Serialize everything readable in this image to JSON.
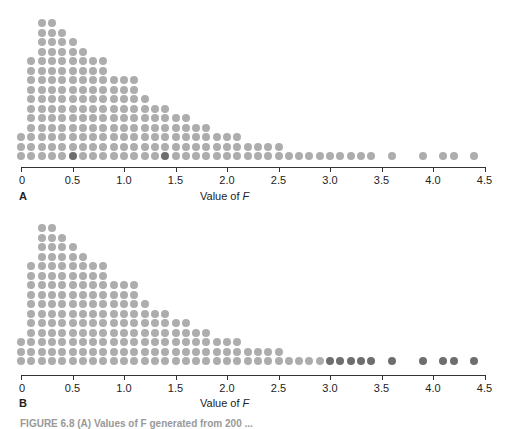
{
  "chart_data": [
    {
      "type": "scatter",
      "subtype": "dot-plot",
      "panel": "A",
      "xlabel": "Value of F",
      "xlim": [
        0,
        4.5
      ],
      "x_ticks": [
        "0",
        "0.5",
        "1.0",
        "1.5",
        "2.0",
        "2.5",
        "3.0",
        "3.5",
        "4.0",
        "4.5"
      ],
      "columns": [
        {
          "x": 0.0,
          "count": 3
        },
        {
          "x": 0.1,
          "count": 11
        },
        {
          "x": 0.2,
          "count": 15
        },
        {
          "x": 0.3,
          "count": 15
        },
        {
          "x": 0.4,
          "count": 14
        },
        {
          "x": 0.5,
          "count": 13
        },
        {
          "x": 0.6,
          "count": 12
        },
        {
          "x": 0.7,
          "count": 11
        },
        {
          "x": 0.8,
          "count": 11
        },
        {
          "x": 0.9,
          "count": 9
        },
        {
          "x": 1.0,
          "count": 9
        },
        {
          "x": 1.1,
          "count": 9
        },
        {
          "x": 1.2,
          "count": 7
        },
        {
          "x": 1.3,
          "count": 6
        },
        {
          "x": 1.4,
          "count": 6
        },
        {
          "x": 1.5,
          "count": 5
        },
        {
          "x": 1.6,
          "count": 5
        },
        {
          "x": 1.7,
          "count": 4
        },
        {
          "x": 1.8,
          "count": 4
        },
        {
          "x": 1.9,
          "count": 3
        },
        {
          "x": 2.0,
          "count": 3
        },
        {
          "x": 2.1,
          "count": 3
        },
        {
          "x": 2.2,
          "count": 2
        },
        {
          "x": 2.3,
          "count": 2
        },
        {
          "x": 2.4,
          "count": 2
        },
        {
          "x": 2.5,
          "count": 2
        },
        {
          "x": 2.6,
          "count": 1
        },
        {
          "x": 2.7,
          "count": 1
        },
        {
          "x": 2.8,
          "count": 1
        },
        {
          "x": 2.9,
          "count": 1
        },
        {
          "x": 3.0,
          "count": 1
        },
        {
          "x": 3.1,
          "count": 1
        },
        {
          "x": 3.2,
          "count": 1
        },
        {
          "x": 3.3,
          "count": 1
        },
        {
          "x": 3.4,
          "count": 1
        },
        {
          "x": 3.6,
          "count": 1
        },
        {
          "x": 3.9,
          "count": 1
        },
        {
          "x": 4.1,
          "count": 1
        },
        {
          "x": 4.2,
          "count": 1
        },
        {
          "x": 4.4,
          "count": 1
        }
      ],
      "highlighted": [
        0.5,
        1.4
      ]
    },
    {
      "type": "scatter",
      "subtype": "dot-plot",
      "panel": "B",
      "xlabel": "Value of F",
      "xlim": [
        0,
        4.5
      ],
      "x_ticks": [
        "0",
        "0.5",
        "1.0",
        "1.5",
        "2.0",
        "2.5",
        "3.0",
        "3.5",
        "4.0",
        "4.5"
      ],
      "columns": "same as panel A",
      "highlighted": [
        3.0,
        3.1,
        3.2,
        3.3,
        3.4,
        3.6,
        3.9,
        4.1,
        4.2,
        4.4
      ]
    }
  ],
  "panels": {
    "a": {
      "letter": "A",
      "xlabel": "Value of ",
      "xlabel_var": "F"
    },
    "b": {
      "letter": "B",
      "xlabel": "Value of ",
      "xlabel_var": "F"
    }
  },
  "ticks": [
    "0",
    "0.5",
    "1.0",
    "1.5",
    "2.0",
    "2.5",
    "3.0",
    "3.5",
    "4.0",
    "4.5"
  ],
  "columns": [
    [
      0.0,
      3
    ],
    [
      0.1,
      11
    ],
    [
      0.2,
      15
    ],
    [
      0.3,
      15
    ],
    [
      0.4,
      14
    ],
    [
      0.5,
      13
    ],
    [
      0.6,
      12
    ],
    [
      0.7,
      11
    ],
    [
      0.8,
      11
    ],
    [
      0.9,
      9
    ],
    [
      1.0,
      9
    ],
    [
      1.1,
      9
    ],
    [
      1.2,
      7
    ],
    [
      1.3,
      6
    ],
    [
      1.4,
      6
    ],
    [
      1.5,
      5
    ],
    [
      1.6,
      5
    ],
    [
      1.7,
      4
    ],
    [
      1.8,
      4
    ],
    [
      1.9,
      3
    ],
    [
      2.0,
      3
    ],
    [
      2.1,
      3
    ],
    [
      2.2,
      2
    ],
    [
      2.3,
      2
    ],
    [
      2.4,
      2
    ],
    [
      2.5,
      2
    ],
    [
      2.6,
      1
    ],
    [
      2.7,
      1
    ],
    [
      2.8,
      1
    ],
    [
      2.9,
      1
    ],
    [
      3.0,
      1
    ],
    [
      3.1,
      1
    ],
    [
      3.2,
      1
    ],
    [
      3.3,
      1
    ],
    [
      3.4,
      1
    ],
    [
      3.6,
      1
    ],
    [
      3.9,
      1
    ],
    [
      4.1,
      1
    ],
    [
      4.2,
      1
    ],
    [
      4.4,
      1
    ]
  ],
  "highlight_a": [
    0.5,
    1.4
  ],
  "highlight_b": [
    3.0,
    3.1,
    3.2,
    3.3,
    3.4,
    3.6,
    3.9,
    4.1,
    4.2,
    4.4
  ],
  "colors": {
    "dot": "#adadad",
    "dot_highlight": "#6e6e6e",
    "axis": "#333333"
  },
  "caption": "FIGURE 6.8 (A) Values of F generated from 200 ..."
}
